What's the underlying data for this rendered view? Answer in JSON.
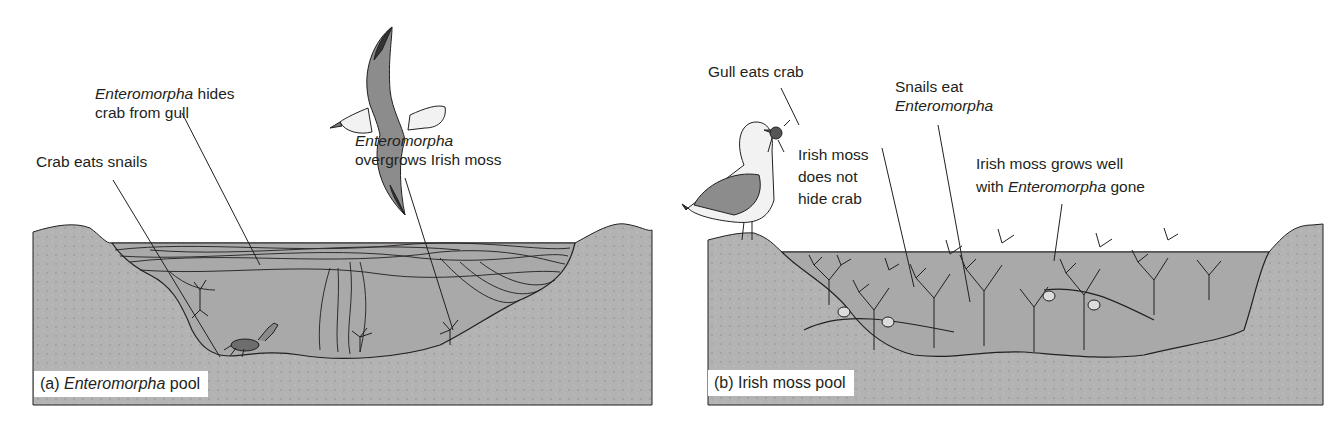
{
  "figure": {
    "colors": {
      "rock": "#b3b3b3",
      "water": "#a9a9a9",
      "outline": "#231f20",
      "gull_body": "#8c8c8c",
      "gull_white": "#f2f2f2",
      "weed_fill": "#d9d9d9",
      "caption_bg": "#ffffff"
    },
    "panel_a": {
      "caption": {
        "prefix": "(a) ",
        "italic": "Enteromorpha",
        "suffix": " pool"
      },
      "labels": {
        "hides_crab": {
          "italic": "Enteromorpha",
          "line1_suffix": " hides",
          "line2": "crab from gull"
        },
        "crab_eats": {
          "line1": "Crab eats snails"
        },
        "overgrows": {
          "italic": "Enteromorpha",
          "line2": "overgrows Irish moss"
        }
      },
      "icons": [
        "flying-gull-icon",
        "crab-icon",
        "irish-moss-icon",
        "enteromorpha-mat-icon"
      ]
    },
    "panel_b": {
      "caption": {
        "text": "(b) Irish moss pool"
      },
      "labels": {
        "gull_eats": {
          "line1": "Gull eats crab"
        },
        "snails_eat": {
          "line1": "Snails eat",
          "italic": "Enteromorpha"
        },
        "not_hide": {
          "line1": "Irish moss",
          "line2": "does not",
          "line3": "hide crab"
        },
        "grows_well": {
          "line1": "Irish moss grows well",
          "line2_prefix": "with ",
          "italic": "Enteromorpha",
          "line2_suffix": " gone"
        }
      },
      "icons": [
        "standing-gull-icon",
        "snail-icon",
        "irish-moss-icon"
      ]
    }
  }
}
